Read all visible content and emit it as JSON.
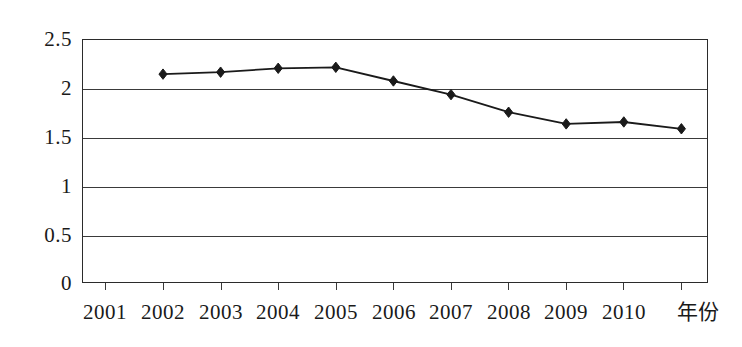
{
  "chart_data": {
    "type": "line",
    "title": "",
    "subtitle": "",
    "xlabel": "年份",
    "ylabel": "",
    "categories": [
      "2001",
      "2002",
      "2003",
      "2004",
      "2005",
      "2006",
      "2007",
      "2008",
      "2009",
      "2010"
    ],
    "x_tick_labels": [
      "2001",
      "2002",
      "2003",
      "2004",
      "2005",
      "2006",
      "2007",
      "2008",
      "2009",
      "2010"
    ],
    "y_tick_labels": [
      "0",
      "0.5",
      "1",
      "1.5",
      "2",
      "2.5"
    ],
    "y_ticks": [
      0,
      0.5,
      1,
      1.5,
      2,
      2.5
    ],
    "ylim": [
      0,
      2.5
    ],
    "grid": true,
    "legend": "none",
    "series": [
      {
        "name": "",
        "marker": "diamond",
        "color": "#1a1a1a",
        "x": [
          2002,
          2003,
          2004,
          2005,
          2006,
          2007,
          2008,
          2009,
          2010,
          2011
        ],
        "values": [
          2.14,
          2.16,
          2.2,
          2.21,
          2.07,
          1.93,
          1.75,
          1.63,
          1.65,
          1.58
        ]
      }
    ]
  },
  "axis": {
    "y_labels": [
      "2.5",
      "2",
      "1.5",
      "1",
      "0.5",
      "0"
    ],
    "x_labels": [
      "2001",
      "2002",
      "2003",
      "2004",
      "2005",
      "2006",
      "2007",
      "2008",
      "2009",
      "2010"
    ],
    "x_title": "年份"
  }
}
